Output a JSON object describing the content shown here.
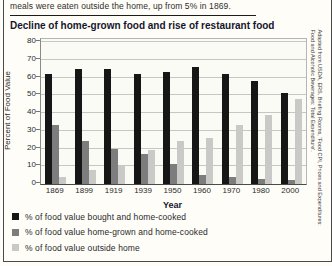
{
  "intro_text": "meals were eaten outside the home, up from 5% in 1869.",
  "figure": {
    "title": "Decline of home-grown food and rise of restaurant food",
    "credit_line1": "Adapted from USDA, ERS, Briefing Rooms, 'Food CPI, Prices and Expenditures:",
    "credit_line2": "Food and Alcoholic Beverages: Total Expenditure'."
  },
  "chart_data": {
    "type": "bar",
    "title": "Decline of home-grown food and rise of restaurant food",
    "categories": [
      "1869",
      "1899",
      "1919",
      "1939",
      "1950",
      "1960",
      "1970",
      "1980",
      "2000"
    ],
    "series": [
      {
        "name": "% of food value bought and home-cooked",
        "color": "#161616",
        "values": [
          62,
          65,
          65,
          62,
          63,
          66,
          62,
          58,
          51
        ]
      },
      {
        "name": "% of food value home-grown and home-cooked",
        "color": "#7d7d7d",
        "values": [
          33,
          24,
          20,
          17,
          11,
          5,
          4,
          3,
          2
        ]
      },
      {
        "name": "% of food value outside home",
        "color": "#c9c9c7",
        "values": [
          4,
          8,
          10,
          19,
          24,
          26,
          33,
          39,
          48
        ]
      }
    ],
    "xlabel": "Year",
    "ylabel": "Percent of Food Value",
    "ylim": [
      0,
      80
    ],
    "yticks": [
      0,
      10,
      20,
      30,
      40,
      50,
      60,
      70,
      80
    ],
    "grid": true,
    "legend_position": "bottom"
  }
}
